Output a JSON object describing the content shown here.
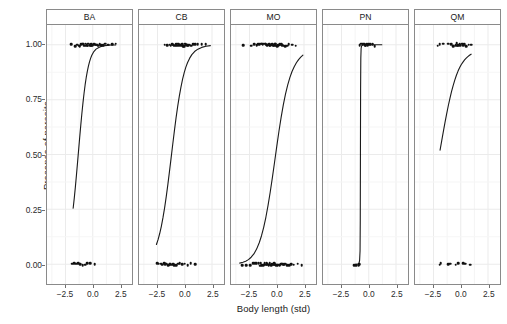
{
  "chart_data": {
    "type": "scatter",
    "title": "",
    "subtitle": "",
    "xlabel": "Body length (std)",
    "ylabel": "Presence of parasite",
    "grid": true,
    "legend": "none",
    "xlim": [
      -4.2,
      3.6
    ],
    "ylim": [
      -0.09,
      1.09
    ],
    "xticks": [
      "-2.5",
      "0.0",
      "2.5"
    ],
    "xtick_values": [
      -2.5,
      0.0,
      2.5
    ],
    "yticks": [
      "0.00",
      "0.25",
      "0.50",
      "0.75",
      "1.00"
    ],
    "ytick_values": [
      0.0,
      0.25,
      0.5,
      0.75,
      1.0
    ],
    "facet_labels": [
      "BA",
      "CB",
      "MO",
      "PN",
      "QM"
    ],
    "panels": [
      {
        "label": "BA",
        "curve_note": "logistic fit rising from 0.25 at x=-1.8 to 1.00 near x=1.6",
        "curve": [
          [
            -1.8,
            0.255
          ],
          [
            -1.7,
            0.3
          ],
          [
            -1.6,
            0.35
          ],
          [
            -1.5,
            0.405
          ],
          [
            -1.4,
            0.462
          ],
          [
            -1.3,
            0.52
          ],
          [
            -1.2,
            0.578
          ],
          [
            -1.1,
            0.634
          ],
          [
            -1.0,
            0.687
          ],
          [
            -0.9,
            0.735
          ],
          [
            -0.8,
            0.779
          ],
          [
            -0.7,
            0.818
          ],
          [
            -0.6,
            0.851
          ],
          [
            -0.5,
            0.879
          ],
          [
            -0.4,
            0.903
          ],
          [
            -0.3,
            0.922
          ],
          [
            -0.2,
            0.938
          ],
          [
            -0.1,
            0.951
          ],
          [
            0.1,
            0.969
          ],
          [
            0.3,
            0.98
          ],
          [
            0.6,
            0.989
          ],
          [
            0.9,
            0.994
          ],
          [
            1.3,
            0.997
          ],
          [
            1.7,
            0.999
          ],
          [
            2.1,
            0.999
          ]
        ],
        "points_y1": [
          -2.0,
          -1.62,
          -1.45,
          -1.3,
          -1.18,
          -1.05,
          -0.96,
          -0.88,
          -0.8,
          -0.72,
          -0.65,
          -0.58,
          -0.5,
          -0.44,
          -0.38,
          -0.3,
          -0.22,
          -0.15,
          -0.08,
          0.0,
          0.08,
          0.16,
          0.24,
          0.32,
          0.42,
          0.52,
          0.64,
          0.78,
          0.95,
          1.15,
          1.42,
          1.78,
          2.1
        ],
        "points_y0": [
          -1.9,
          -1.72,
          -1.55,
          -1.38,
          -1.15,
          -0.95,
          -0.72,
          -0.48,
          -0.2,
          0.15
        ]
      },
      {
        "label": "CB",
        "curve_note": "logistic fit rising from 0.09 at x=-2.6 to 1.00 near x=1.5",
        "curve": [
          [
            -2.6,
            0.09
          ],
          [
            -2.45,
            0.112
          ],
          [
            -2.3,
            0.14
          ],
          [
            -2.15,
            0.173
          ],
          [
            -2.0,
            0.212
          ],
          [
            -1.85,
            0.257
          ],
          [
            -1.7,
            0.308
          ],
          [
            -1.55,
            0.364
          ],
          [
            -1.4,
            0.424
          ],
          [
            -1.25,
            0.486
          ],
          [
            -1.1,
            0.548
          ],
          [
            -0.95,
            0.609
          ],
          [
            -0.8,
            0.667
          ],
          [
            -0.65,
            0.719
          ],
          [
            -0.5,
            0.766
          ],
          [
            -0.35,
            0.807
          ],
          [
            -0.2,
            0.843
          ],
          [
            -0.05,
            0.873
          ],
          [
            0.1,
            0.898
          ],
          [
            0.25,
            0.918
          ],
          [
            0.45,
            0.939
          ],
          [
            0.65,
            0.955
          ],
          [
            0.9,
            0.969
          ],
          [
            1.2,
            0.98
          ],
          [
            1.55,
            0.988
          ],
          [
            1.95,
            0.993
          ],
          [
            2.35,
            0.996
          ]
        ],
        "points_y1": [
          -1.85,
          -1.6,
          -1.42,
          -1.28,
          -1.15,
          -1.05,
          -0.95,
          -0.86,
          -0.78,
          -0.7,
          -0.62,
          -0.55,
          -0.48,
          -0.4,
          -0.32,
          -0.25,
          -0.18,
          -0.1,
          -0.02,
          0.06,
          0.14,
          0.22,
          0.32,
          0.44,
          0.58,
          0.75,
          0.95,
          1.22,
          1.55,
          1.95
        ],
        "points_y0": [
          -2.55,
          -2.35,
          -2.18,
          -2.05,
          -1.92,
          -1.8,
          -1.68,
          -1.55,
          -1.42,
          -1.3,
          -1.18,
          -1.05,
          -0.92,
          -0.78,
          -0.62,
          -0.45,
          -0.25,
          0.0,
          0.25,
          0.55,
          0.95
        ]
      },
      {
        "label": "MO",
        "curve_note": "logistic fit rising from 0.00 at x=-3.4 to 0.85 at x=2.4",
        "curve": [
          [
            -3.4,
            0.005
          ],
          [
            -3.1,
            0.009
          ],
          [
            -2.85,
            0.014
          ],
          [
            -2.6,
            0.021
          ],
          [
            -2.35,
            0.032
          ],
          [
            -2.1,
            0.047
          ],
          [
            -1.85,
            0.069
          ],
          [
            -1.6,
            0.099
          ],
          [
            -1.4,
            0.13
          ],
          [
            -1.2,
            0.168
          ],
          [
            -1.0,
            0.214
          ],
          [
            -0.8,
            0.268
          ],
          [
            -0.6,
            0.329
          ],
          [
            -0.4,
            0.396
          ],
          [
            -0.2,
            0.466
          ],
          [
            0.0,
            0.537
          ],
          [
            0.2,
            0.606
          ],
          [
            0.4,
            0.669
          ],
          [
            0.6,
            0.726
          ],
          [
            0.8,
            0.775
          ],
          [
            1.0,
            0.816
          ],
          [
            1.2,
            0.85
          ],
          [
            1.4,
            0.878
          ],
          [
            1.6,
            0.9
          ],
          [
            1.8,
            0.918
          ],
          [
            2.0,
            0.932
          ],
          [
            2.2,
            0.944
          ],
          [
            2.4,
            0.953
          ]
        ],
        "points_y1": [
          -3.05,
          -2.3,
          -2.05,
          -1.85,
          -1.68,
          -1.55,
          -1.44,
          -1.34,
          -1.25,
          -1.16,
          -1.08,
          -1.0,
          -0.92,
          -0.85,
          -0.78,
          -0.7,
          -0.63,
          -0.56,
          -0.48,
          -0.41,
          -0.34,
          -0.27,
          -0.19,
          -0.12,
          -0.04,
          0.04,
          0.12,
          0.21,
          0.3,
          0.4,
          0.51,
          0.63,
          0.77,
          0.93,
          1.12,
          1.38,
          1.75
        ],
        "points_y0": [
          -3.15,
          -2.75,
          -2.45,
          -2.18,
          -1.98,
          -1.82,
          -1.68,
          -1.56,
          -1.45,
          -1.35,
          -1.26,
          -1.17,
          -1.08,
          -1.0,
          -0.92,
          -0.84,
          -0.77,
          -0.69,
          -0.62,
          -0.55,
          -0.48,
          -0.41,
          -0.34,
          -0.27,
          -0.2,
          -0.13,
          -0.06,
          0.01,
          0.08,
          0.16,
          0.24,
          0.32,
          0.41,
          0.5,
          0.6,
          0.71,
          0.83,
          0.97,
          1.13,
          1.32,
          1.56,
          1.88,
          2.25
        ]
      },
      {
        "label": "PN",
        "curve_note": "near-vertical step: separation at x=-0.75, jumps 0.00 to 1.00",
        "curve": [
          [
            -1.25,
            0.0
          ],
          [
            -1.0,
            0.001
          ],
          [
            -0.9,
            0.004
          ],
          [
            -0.84,
            0.018
          ],
          [
            -0.8,
            0.06
          ],
          [
            -0.78,
            0.2
          ],
          [
            -0.765,
            0.5
          ],
          [
            -0.75,
            0.8
          ],
          [
            -0.73,
            0.94
          ],
          [
            -0.7,
            0.985
          ],
          [
            -0.64,
            0.997
          ],
          [
            -0.55,
            0.999
          ],
          [
            -0.4,
            1.0
          ],
          [
            0.0,
            1.0
          ],
          [
            0.6,
            1.0
          ],
          [
            1.2,
            1.0
          ]
        ],
        "points_y1": [
          -0.82,
          -0.7,
          -0.58,
          -0.48,
          -0.4,
          -0.33,
          -0.26,
          -0.19,
          -0.12,
          -0.04,
          0.06,
          0.18,
          0.34,
          0.55
        ],
        "points_y0": [
          -1.28,
          -1.1,
          -0.95,
          -0.86
        ]
      },
      {
        "label": "QM",
        "curve_note": "shallow logistic fit from 0.52 at x=-1.9 to 0.93 at x=0.9",
        "curve": [
          [
            -1.9,
            0.52
          ],
          [
            -1.75,
            0.562
          ],
          [
            -1.6,
            0.604
          ],
          [
            -1.45,
            0.645
          ],
          [
            -1.3,
            0.684
          ],
          [
            -1.15,
            0.721
          ],
          [
            -1.0,
            0.755
          ],
          [
            -0.85,
            0.786
          ],
          [
            -0.7,
            0.814
          ],
          [
            -0.55,
            0.839
          ],
          [
            -0.4,
            0.861
          ],
          [
            -0.25,
            0.88
          ],
          [
            -0.1,
            0.896
          ],
          [
            0.05,
            0.91
          ],
          [
            0.2,
            0.921
          ],
          [
            0.35,
            0.931
          ],
          [
            0.5,
            0.939
          ],
          [
            0.65,
            0.946
          ],
          [
            0.8,
            0.952
          ],
          [
            0.95,
            0.957
          ]
        ],
        "points_y1": [
          -2.1,
          -1.95,
          -1.6,
          -1.1,
          -0.9,
          -0.72,
          -0.6,
          -0.5,
          -0.4,
          -0.3,
          -0.2,
          -0.1,
          0.0,
          0.1,
          0.22,
          0.36,
          0.52,
          0.72,
          0.98
        ],
        "points_y0": [
          -1.95,
          -1.8,
          -1.15,
          -0.95,
          -0.45,
          -0.25,
          0.22,
          0.45,
          0.85
        ]
      }
    ]
  },
  "axes": {
    "y_title": "Presence of parasite",
    "x_title": "Body length (std)"
  },
  "colors": {
    "point": "#111111",
    "curve": "#1a1a1a",
    "grid": "#ebebeb",
    "panel_border": "#8a8a8a",
    "background": "#ffffff",
    "text": "#1a1a1a"
  }
}
